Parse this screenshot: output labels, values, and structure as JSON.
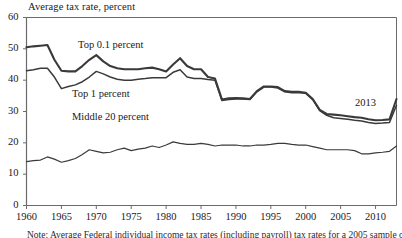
{
  "chart_data": {
    "type": "line",
    "title": "Average tax rate, percent",
    "xlabel": "",
    "ylabel": "Average tax rate, percent",
    "ylim": [
      0,
      60
    ],
    "xlim": [
      1960,
      2013
    ],
    "grid": false,
    "legend_position": "inline-annotations",
    "yticks": [
      0,
      10,
      20,
      30,
      40,
      50,
      60
    ],
    "xticks": [
      1960,
      1965,
      1970,
      1975,
      1980,
      1985,
      1990,
      1995,
      2000,
      2005,
      2010
    ],
    "annotations": [
      "2013"
    ],
    "x": [
      1960,
      1961,
      1962,
      1963,
      1964,
      1965,
      1966,
      1967,
      1968,
      1969,
      1970,
      1971,
      1972,
      1973,
      1974,
      1975,
      1976,
      1977,
      1978,
      1979,
      1980,
      1981,
      1982,
      1983,
      1984,
      1985,
      1986,
      1987,
      1988,
      1989,
      1990,
      1991,
      1992,
      1993,
      1994,
      1995,
      1996,
      1997,
      1998,
      1999,
      2000,
      2001,
      2002,
      2003,
      2004,
      2005,
      2006,
      2007,
      2008,
      2009,
      2010,
      2011,
      2012,
      2013
    ],
    "series": [
      {
        "name": "Top 0.1 percent",
        "values": [
          50.5,
          50.8,
          51.0,
          51.2,
          46.5,
          43.0,
          42.8,
          42.8,
          44.5,
          46.5,
          48.0,
          46.0,
          44.5,
          43.8,
          43.5,
          43.5,
          43.5,
          43.8,
          44.0,
          43.5,
          42.8,
          45.0,
          47.0,
          44.5,
          43.5,
          43.5,
          41.0,
          40.5,
          33.8,
          34.2,
          34.3,
          34.2,
          34.0,
          36.5,
          38.0,
          38.0,
          37.8,
          36.5,
          36.3,
          36.3,
          36.0,
          34.0,
          30.5,
          29.2,
          29.0,
          28.8,
          28.5,
          28.2,
          28.0,
          27.5,
          27.2,
          27.3,
          27.5,
          34.0
        ]
      },
      {
        "name": "Top 1 percent",
        "values": [
          43.0,
          43.3,
          43.8,
          43.8,
          41.0,
          37.3,
          38.0,
          38.5,
          39.5,
          41.0,
          42.8,
          42.0,
          41.0,
          40.3,
          40.0,
          40.0,
          40.3,
          40.5,
          40.8,
          40.8,
          40.8,
          42.5,
          43.3,
          41.0,
          40.5,
          40.5,
          40.2,
          40.0,
          33.5,
          33.8,
          34.0,
          34.0,
          33.8,
          36.3,
          37.8,
          37.8,
          37.5,
          36.3,
          36.0,
          36.0,
          35.8,
          33.8,
          30.3,
          28.8,
          28.0,
          27.8,
          27.5,
          27.2,
          27.0,
          26.5,
          26.2,
          26.3,
          26.5,
          32.0
        ]
      },
      {
        "name": "Middle 20 percent",
        "values": [
          14.0,
          14.3,
          14.5,
          15.5,
          14.8,
          13.8,
          14.3,
          15.0,
          16.3,
          17.8,
          17.3,
          16.8,
          17.0,
          17.8,
          18.3,
          17.5,
          18.0,
          18.3,
          19.0,
          18.5,
          19.3,
          20.3,
          19.8,
          19.5,
          19.5,
          19.8,
          19.5,
          19.0,
          19.3,
          19.3,
          19.3,
          19.0,
          19.0,
          19.3,
          19.3,
          19.5,
          19.8,
          19.8,
          19.5,
          19.3,
          19.3,
          18.8,
          18.3,
          17.8,
          17.8,
          17.8,
          17.8,
          17.5,
          16.5,
          16.5,
          16.8,
          17.0,
          17.3,
          19.0
        ]
      }
    ]
  },
  "labels": {
    "top01": "Top 0.1 percent",
    "top1": "Top 1 percent",
    "middle20": "Middle 20 percent",
    "end_year": "2013"
  },
  "note": "Note:  Average Federal individual income tax rates (including payroll) tax rates for a 2005 sample of taxpayers",
  "colors": {
    "line_dark": "#3a3a3a",
    "axis": "#6b6b6b",
    "text": "#1a1a1a"
  }
}
